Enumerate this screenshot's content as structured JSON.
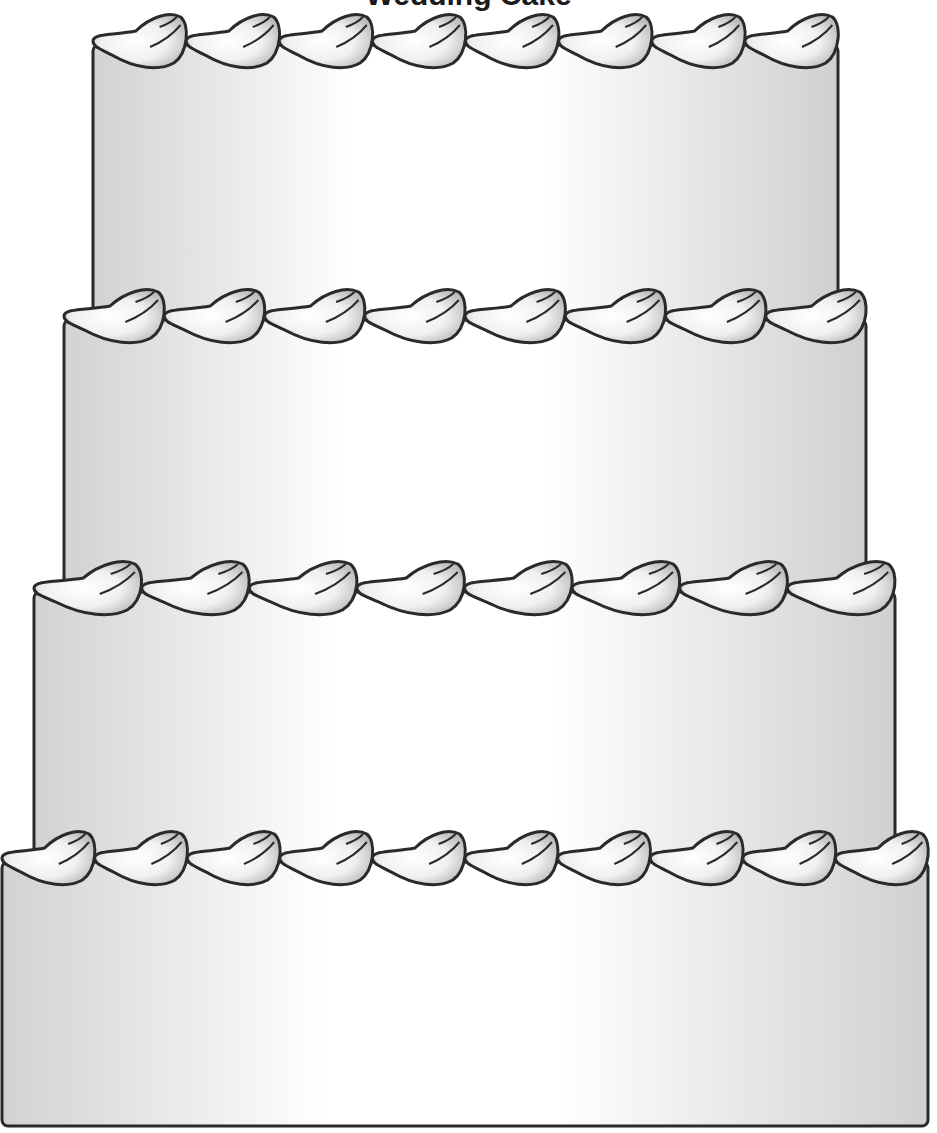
{
  "title": "Wedding Cake",
  "colors": {
    "outline": "#2a2a2a",
    "fill_edge": "#d4d4d4",
    "fill_center": "#ffffff"
  },
  "tiers": [
    {
      "name": "tier-1",
      "x": 93,
      "y": 45,
      "w": 745,
      "h": 270,
      "dollops": 8
    },
    {
      "name": "tier-2",
      "x": 64,
      "y": 320,
      "w": 802,
      "h": 270,
      "dollops": 8
    },
    {
      "name": "tier-3",
      "x": 34,
      "y": 592,
      "w": 861,
      "h": 268,
      "dollops": 8
    },
    {
      "name": "tier-4",
      "x": 2,
      "y": 862,
      "w": 926,
      "h": 264,
      "dollops": 10
    }
  ]
}
